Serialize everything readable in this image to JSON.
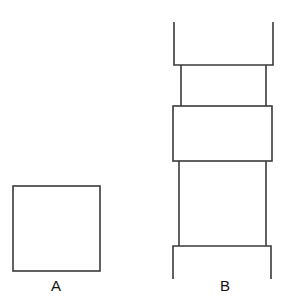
{
  "figures": {
    "a": {
      "label": "A",
      "kind": "square"
    },
    "b": {
      "label": "B",
      "kind": "stacked-segmented-column"
    }
  },
  "colors": {
    "stroke": "#3a3a3a",
    "background": "#ffffff",
    "text": "#111111"
  }
}
